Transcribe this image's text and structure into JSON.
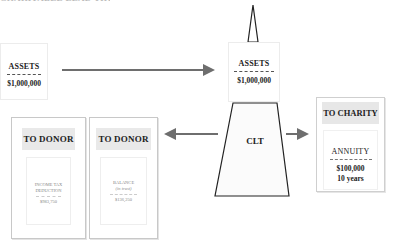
{
  "header": {
    "title_cut": "CHARITABLE LEAD TRUST"
  },
  "source_assets": {
    "label": "ASSETS",
    "value": "$1,000,000"
  },
  "trust_assets": {
    "label": "ASSETS",
    "value": "$1,000,000"
  },
  "trust": {
    "label": "CLT"
  },
  "donor_boxes": [
    {
      "heading": "TO DONOR",
      "line1": "INCOME TAX",
      "line2": "DEDUCTION",
      "value": "$983,750"
    },
    {
      "heading": "TO DONOR",
      "line1": "BALANCE",
      "line2": "(in trust)",
      "value": "$136,250"
    }
  ],
  "charity": {
    "heading": "TO CHARITY",
    "label": "ANNUITY",
    "amount": "$100,000",
    "term": "10 years"
  },
  "colors": {
    "arrow": "#6e6e6e",
    "outline": "#222222",
    "header_fill": "#e8e8e8"
  }
}
